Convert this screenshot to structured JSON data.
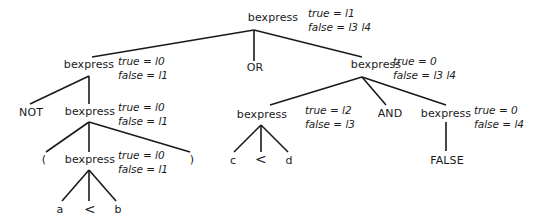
{
  "diagram": {
    "type": "parse-tree",
    "nodes": {
      "root": {
        "label": "bexpress",
        "true": "true = l1",
        "false": "false = l3 l4"
      },
      "left1": {
        "label": "bexpress",
        "true": "true = l0",
        "false": "false = l1"
      },
      "or": {
        "label": "OR"
      },
      "right1": {
        "label": "bexpress",
        "true": "true = 0",
        "false": "false = l3 l4"
      },
      "not": {
        "label": "NOT"
      },
      "left2": {
        "label": "bexpress",
        "true": "true = l0",
        "false": "false = l1"
      },
      "lparen": {
        "label": "("
      },
      "left3": {
        "label": "bexpress",
        "true": "true = l0",
        "false": "false = l1"
      },
      "rparen": {
        "label": ")"
      },
      "a": {
        "label": "a"
      },
      "lt1": {
        "label": "<"
      },
      "b": {
        "label": "b"
      },
      "cd": {
        "label": "bexpress",
        "true": "true = l2",
        "false": "false = l3"
      },
      "and": {
        "label": "AND"
      },
      "falsenode": {
        "label": "bexpress",
        "true": "true = 0",
        "false": "false = l4"
      },
      "c": {
        "label": "c"
      },
      "lt2": {
        "label": "<"
      },
      "d": {
        "label": "d"
      },
      "falselit": {
        "label": "FALSE"
      }
    },
    "colors": {
      "line": "#1a1a1a",
      "text": "#1a1a1a",
      "background": "#ffffff"
    }
  }
}
